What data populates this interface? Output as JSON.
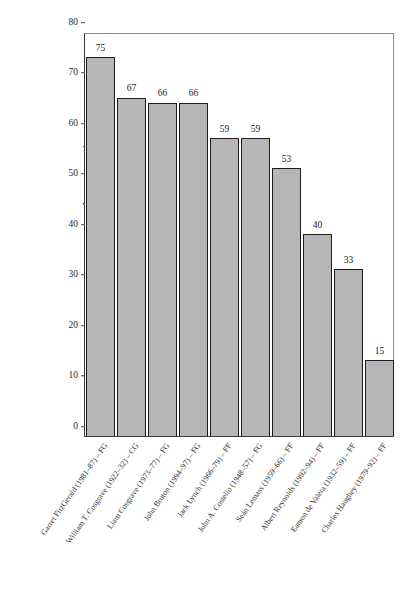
{
  "chart_data": {
    "type": "bar",
    "title": "",
    "xlabel": "",
    "ylabel": "Average rating",
    "ylim": [
      0,
      80
    ],
    "yticks": [
      0,
      10,
      20,
      30,
      40,
      50,
      60,
      70,
      80
    ],
    "grid": false,
    "legend": "none",
    "bar_color": "#b6b6b6",
    "bar_edge_color": "#1c1c1c",
    "categories": [
      "Garret FitzGerald (1981–87) – FG",
      "William T. Cosgrave (1922–32) – CG",
      "Liam Cosgrave (1973–77) – FG",
      "John Bruton (1994–97) – FG",
      "Jack Lynch (1966–79) – FF",
      "John A. Costello (1948–57) – FG",
      "Seán Lemass (1959–66) – FF",
      "Albert Reynolds (1992–94) – FF",
      "Eamon de Valera (1932–59) – FF",
      "Charles Haughey (1979–92) – FF"
    ],
    "values": [
      75,
      67,
      66,
      66,
      59,
      59,
      53,
      40,
      33,
      15
    ],
    "value_labels": [
      "75",
      "67",
      "66",
      "66",
      "59",
      "59",
      "53",
      "40",
      "33",
      "15"
    ],
    "tick_labels": [
      "0",
      "10",
      "20",
      "30",
      "40",
      "50",
      "60",
      "70",
      "80"
    ]
  }
}
